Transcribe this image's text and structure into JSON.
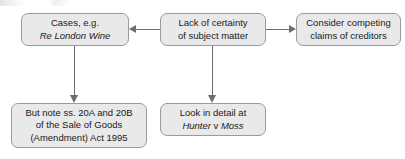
{
  "diagram": {
    "type": "flowchart",
    "nodes": [
      {
        "id": "cases",
        "lines": [
          {
            "text": "Cases, e.g.",
            "style": "normal"
          },
          {
            "text": "Re London Wine",
            "style": "italic"
          }
        ]
      },
      {
        "id": "lack",
        "lines": [
          {
            "text": "Lack of certainty",
            "style": "normal"
          },
          {
            "text": "of subject matter",
            "style": "normal"
          }
        ]
      },
      {
        "id": "creditors",
        "lines": [
          {
            "text": "Consider competing",
            "style": "normal"
          },
          {
            "text": "claims of creditors",
            "style": "normal"
          }
        ]
      },
      {
        "id": "statute",
        "lines": [
          {
            "text": "But note ss. 20A and 20B",
            "style": "normal"
          },
          {
            "text": "of the Sale of Goods",
            "style": "normal"
          },
          {
            "text": "(Amendment) Act 1995",
            "style": "normal"
          }
        ]
      },
      {
        "id": "hunter",
        "lines": [
          {
            "text": "Look in detail at",
            "style": "normal"
          },
          {
            "text_parts": [
              {
                "text": "Hunter",
                "style": "italic"
              },
              {
                "text": " v ",
                "style": "normal"
              },
              {
                "text": "Moss",
                "style": "italic"
              }
            ]
          }
        ]
      }
    ],
    "edges": [
      {
        "from": "lack",
        "to": "cases",
        "direction": "left"
      },
      {
        "from": "lack",
        "to": "creditors",
        "direction": "right"
      },
      {
        "from": "cases",
        "to": "statute",
        "direction": "down"
      },
      {
        "from": "lack",
        "to": "hunter",
        "direction": "down"
      }
    ],
    "colors": {
      "node_fill": "#e9e9e9",
      "node_border": "#9a9a9a",
      "connector": "#6e6e6e",
      "text": "#1a1a1a",
      "background": "#ffffff"
    }
  }
}
